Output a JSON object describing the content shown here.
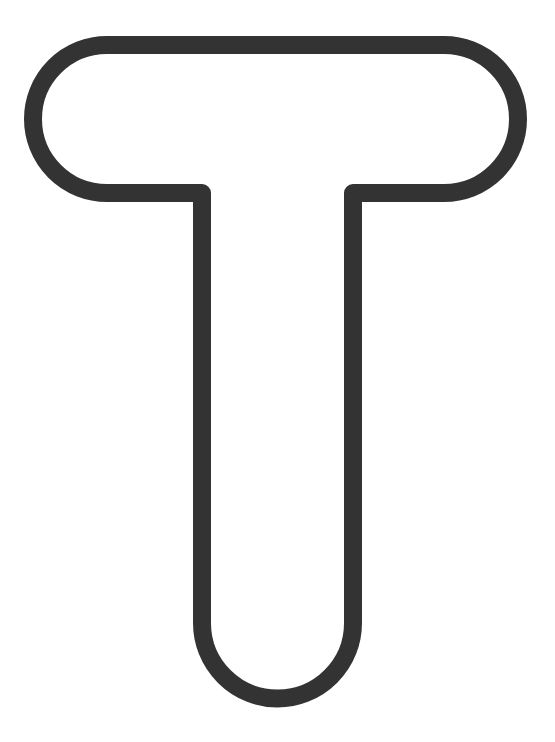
{
  "document": {
    "kind": "letterform-outline",
    "title": "Letter T Outline",
    "character": "T",
    "description": "Hollow outlined capital letter T with fully rounded stroke terminals"
  },
  "canvas": {
    "width": 555,
    "height": 742,
    "background_color": "#ffffff"
  },
  "glyph": {
    "name": "letter-t-outline",
    "character": "T",
    "stroke_color": "#333333",
    "stroke_width": 18,
    "fill": "none",
    "line_join": "round",
    "line_cap": "round",
    "crossbar": {
      "outer_left": 33,
      "outer_right": 518,
      "outer_top": 45,
      "outer_bottom": 193,
      "outer_width": 485,
      "outer_height": 148,
      "cap_radius": 74,
      "cap_style": "round"
    },
    "stem": {
      "outer_left": 202,
      "outer_right": 353,
      "outer_width": 151,
      "outer_top": 193,
      "outer_bottom": 698,
      "center_x": 277,
      "foot_radius": 75,
      "foot_style": "round"
    },
    "path": "M 107 45 L 444 45 A 74 74 0 0 1 444 193 L 353 193 L 353 623 A 75 75 0 0 1 202 623 L 202 193 L 107 193 A 74 74 0 0 1 107 45 Z"
  }
}
